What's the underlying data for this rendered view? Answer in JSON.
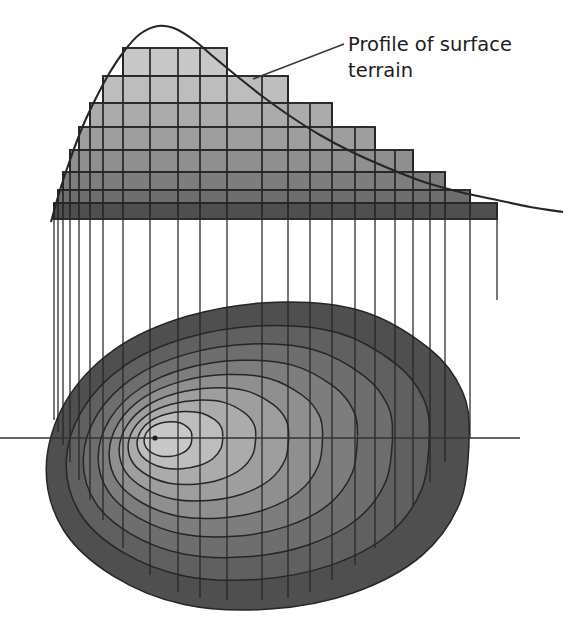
{
  "figure": {
    "name": "terrain-profile-and-contour-map",
    "background": "#ffffff",
    "width": 572,
    "height": 617,
    "line_color": "#262626",
    "annotation": {
      "line1": "Profile of surface",
      "line2": "terrain",
      "leader_from": [
        253,
        79
      ],
      "leader_to": [
        344,
        44
      ],
      "text_x": 348,
      "text_y": 44,
      "font_size": 19.5,
      "color": "#1d1d1d"
    }
  },
  "palette": {
    "band_1_highest": "#c8c8c8",
    "band_2": "#bdbdbd",
    "band_3": "#ababab",
    "band_4": "#9e9e9e",
    "band_5": "#8f8f8f",
    "band_6": "#7d7d7d",
    "band_7": "#6e6e6e",
    "band_8": "#606060",
    "band_9_lowest": "#4f4f4f",
    "outline": "#262626",
    "axis": "#333333"
  },
  "profile": {
    "type": "stepped-cross-section",
    "baseline_y": 219,
    "peak": {
      "x": 158,
      "y": 26
    },
    "curve_left_x": 51,
    "curve_right_x": 563,
    "curve_points": [
      [
        51,
        222
      ],
      [
        60,
        190
      ],
      [
        70,
        160
      ],
      [
        82,
        128
      ],
      [
        95,
        100
      ],
      [
        110,
        72
      ],
      [
        125,
        50
      ],
      [
        140,
        34
      ],
      [
        158,
        26
      ],
      [
        176,
        29
      ],
      [
        195,
        41
      ],
      [
        215,
        58
      ],
      [
        238,
        77
      ],
      [
        262,
        96
      ],
      [
        290,
        116
      ],
      [
        320,
        135
      ],
      [
        352,
        152
      ],
      [
        388,
        168
      ],
      [
        424,
        182
      ],
      [
        460,
        192
      ],
      [
        497,
        200
      ],
      [
        530,
        207
      ],
      [
        563,
        212
      ]
    ],
    "step_bands": [
      {
        "index": 1,
        "tone": "#c8c8c8",
        "top_y": 48,
        "left_x": 123,
        "right_x": 227
      },
      {
        "index": 2,
        "tone": "#bdbdbd",
        "top_y": 76,
        "left_x": 103,
        "right_x": 288
      },
      {
        "index": 3,
        "tone": "#ababab",
        "top_y": 103,
        "left_x": 90,
        "right_x": 332
      },
      {
        "index": 4,
        "tone": "#9e9e9e",
        "top_y": 127,
        "left_x": 79,
        "right_x": 375
      },
      {
        "index": 5,
        "tone": "#8f8f8f",
        "top_y": 150,
        "left_x": 70,
        "right_x": 413
      },
      {
        "index": 6,
        "tone": "#7d7d7d",
        "top_y": 172,
        "left_x": 63,
        "right_x": 445
      },
      {
        "index": 7,
        "tone": "#6e6e6e",
        "top_y": 190,
        "left_x": 58,
        "right_x": 470
      },
      {
        "index": 8,
        "tone": "#4f4f4f",
        "top_y": 203,
        "left_x": 54,
        "right_x": 497
      }
    ],
    "grid_columns": [
      54,
      58,
      63,
      70,
      79,
      90,
      103,
      123,
      150,
      178,
      200,
      227,
      262,
      288,
      310,
      332,
      355,
      375,
      395,
      413,
      430,
      445,
      470,
      497
    ]
  },
  "projection_lines": {
    "description": "vertical tie lines from profile baseline down to contour map",
    "top_y": 219,
    "x_positions": [
      54,
      58,
      63,
      70,
      79,
      90,
      103,
      123,
      150,
      178,
      200,
      227,
      262,
      288,
      310,
      332,
      355,
      375,
      395,
      413,
      430,
      445,
      470,
      497
    ],
    "bottom_ys": [
      420,
      432,
      445,
      462,
      480,
      500,
      520,
      548,
      575,
      592,
      598,
      600,
      600,
      598,
      592,
      580,
      565,
      548,
      528,
      505,
      482,
      462,
      438,
      300
    ]
  },
  "contour_map": {
    "type": "nested-closed-isolines",
    "summit_dot": {
      "x": 155,
      "y": 438,
      "r": 2.6
    },
    "axis_line": {
      "x1": 0,
      "x2": 520,
      "y": 438
    },
    "rings": [
      {
        "index": 9,
        "tone": "#4f4f4f",
        "cx": 258,
        "cy": 455,
        "rx": 212,
        "ry": 150,
        "rot": -6
      },
      {
        "index": 8,
        "tone": "#606060",
        "cx": 248,
        "cy": 452,
        "rx": 182,
        "ry": 124,
        "rot": -6
      },
      {
        "index": 7,
        "tone": "#6e6e6e",
        "cx": 238,
        "cy": 450,
        "rx": 155,
        "ry": 104,
        "rot": -6
      },
      {
        "index": 6,
        "tone": "#7d7d7d",
        "cx": 228,
        "cy": 448,
        "rx": 130,
        "ry": 86,
        "rot": -6
      },
      {
        "index": 5,
        "tone": "#8f8f8f",
        "cx": 216,
        "cy": 446,
        "rx": 107,
        "ry": 70,
        "rot": -6
      },
      {
        "index": 4,
        "tone": "#9e9e9e",
        "cx": 204,
        "cy": 444,
        "rx": 85,
        "ry": 55,
        "rot": -6
      },
      {
        "index": 3,
        "tone": "#ababab",
        "cx": 192,
        "cy": 442,
        "rx": 64,
        "ry": 41,
        "rot": -6
      },
      {
        "index": 2,
        "tone": "#bdbdbd",
        "cx": 180,
        "cy": 440,
        "rx": 43,
        "ry": 28,
        "rot": -6
      },
      {
        "index": 1,
        "tone": "#c8c8c8",
        "cx": 168,
        "cy": 439,
        "rx": 24,
        "ry": 17,
        "rot": -6
      }
    ]
  }
}
